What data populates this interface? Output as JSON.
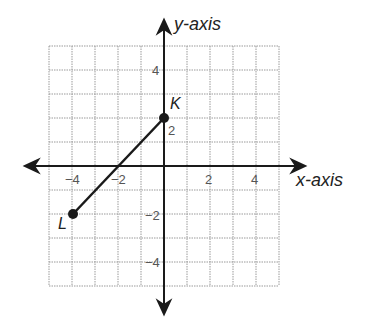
{
  "axes": {
    "x_label": "x-axis",
    "y_label": "y-axis",
    "range": [
      -5,
      5
    ],
    "x_ticks": [
      {
        "value": -4,
        "label": "−4"
      },
      {
        "value": -2,
        "label": "−2"
      },
      {
        "value": 2,
        "label": "2"
      },
      {
        "value": 4,
        "label": "4"
      }
    ],
    "y_ticks": [
      {
        "value": 4,
        "label": "4"
      },
      {
        "value": 2,
        "label": "2"
      },
      {
        "value": -2,
        "label": "−2"
      },
      {
        "value": -4,
        "label": "−4"
      }
    ]
  },
  "points": [
    {
      "name": "K",
      "x": 0,
      "y": 2
    },
    {
      "name": "L",
      "x": -4,
      "y": -2
    }
  ],
  "segment": {
    "from": "L",
    "to": "K"
  },
  "colors": {
    "line": "#1a1a1a",
    "grid": "#9a9a9a"
  }
}
